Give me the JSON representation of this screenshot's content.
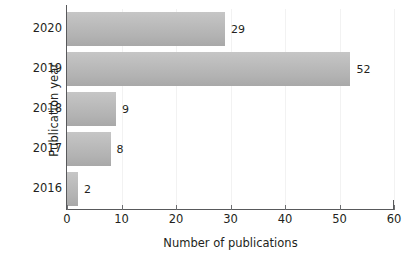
{
  "chart_data": {
    "type": "bar",
    "orientation": "horizontal",
    "title": "",
    "xlabel": "Number of publications",
    "ylabel": "Publication year",
    "categories": [
      "2020",
      "2019",
      "2018",
      "2017",
      "2016"
    ],
    "values": [
      29,
      52,
      9,
      8,
      2
    ],
    "data_labels": [
      "29",
      "52",
      "9",
      "8",
      "2"
    ],
    "xlim": [
      0,
      60
    ],
    "xticks": [
      0,
      10,
      20,
      30,
      40,
      50,
      60
    ],
    "xtick_labels": [
      "0",
      "10",
      "20",
      "30",
      "40",
      "50",
      "60"
    ],
    "grid": "vertical-faint",
    "legend": "none",
    "series": [
      {
        "name": "Number of publications",
        "values": [
          29,
          52,
          9,
          8,
          2
        ]
      }
    ],
    "colors": {
      "bar_fill_top": "#c6c6c6",
      "bar_fill_bottom": "#a8a8a8",
      "axis": "#58595b",
      "text": "#231f20",
      "gridline": "#f2f2f2",
      "background": "#ffffff"
    }
  }
}
